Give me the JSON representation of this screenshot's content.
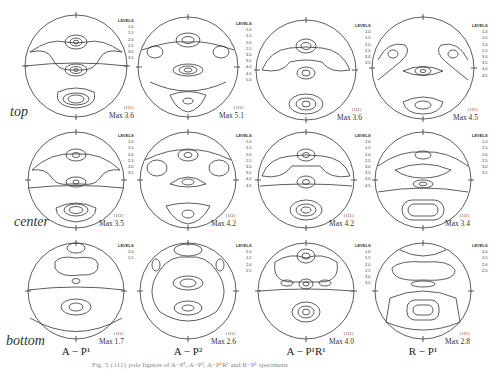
{
  "figure": {
    "row_labels": [
      "top",
      "center",
      "bottom"
    ],
    "column_labels": [
      "A − P¹",
      "A − P²",
      "A − P¹R¹",
      "R − P¹"
    ],
    "pole_figure_label": "{111}",
    "legend_header": "LEVELS",
    "rd_label": "RD",
    "panels": [
      {
        "row": "top",
        "col": "A − P¹",
        "max": "Max 3.6",
        "levels": [
          "1.0",
          "1.5",
          "2.0",
          "2.5",
          "3.0",
          "3.5"
        ]
      },
      {
        "row": "top",
        "col": "A − P²",
        "max": "Max 5.1",
        "levels": [
          "1.0",
          "1.5",
          "2.0",
          "2.5",
          "3.0",
          "3.5",
          "4.0",
          "4.5",
          "5.0"
        ]
      },
      {
        "row": "top",
        "col": "A − P¹R¹",
        "max": "Max 3.6",
        "levels": [
          "1.0",
          "1.5",
          "2.0",
          "2.5",
          "3.0",
          "3.5"
        ]
      },
      {
        "row": "top",
        "col": "R − P¹",
        "max": "Max 4.5",
        "levels": [
          "1.0",
          "1.5",
          "2.0",
          "2.5",
          "3.0",
          "3.5",
          "4.0",
          "4.5"
        ]
      },
      {
        "row": "center",
        "col": "A − P¹",
        "max": "Max 3.5",
        "levels": [
          "1.0",
          "1.5",
          "2.0",
          "2.5",
          "3.0",
          "3.5"
        ]
      },
      {
        "row": "center",
        "col": "A − P²",
        "max": "Max 4.2",
        "levels": [
          "1.0",
          "1.5",
          "2.0",
          "2.5",
          "3.0",
          "3.5",
          "4.0",
          "4.5"
        ]
      },
      {
        "row": "center",
        "col": "A − P¹R¹",
        "max": "Max 4.2",
        "levels": [
          "1.0",
          "1.5",
          "2.0",
          "2.5",
          "3.0",
          "3.5",
          "4.0",
          "4.5"
        ]
      },
      {
        "row": "center",
        "col": "R − P¹",
        "max": "Max 3.4",
        "levels": [
          "1.0",
          "1.5",
          "2.0",
          "2.5",
          "3.0",
          "3.5"
        ]
      },
      {
        "row": "bottom",
        "col": "A − P¹",
        "max": "Max 1.7",
        "levels": [
          "1.0",
          "1.5"
        ]
      },
      {
        "row": "bottom",
        "col": "A − P²",
        "max": "Max 2.6",
        "levels": [
          "1.0",
          "1.5",
          "2.0",
          "2.5"
        ]
      },
      {
        "row": "bottom",
        "col": "A − P¹R¹",
        "max": "Max 4.0",
        "levels": [
          "1.0",
          "1.5",
          "2.0",
          "2.5",
          "3.0",
          "3.5"
        ]
      },
      {
        "row": "bottom",
        "col": "R − P¹",
        "max": "Max 2.8",
        "levels": [
          "1.0",
          "1.5",
          "2.0",
          "2.5"
        ]
      }
    ],
    "caption": "Fig. 5  {111} pole figures of A−P¹, A−P², A−P¹R¹ and R−P¹ specimens"
  }
}
